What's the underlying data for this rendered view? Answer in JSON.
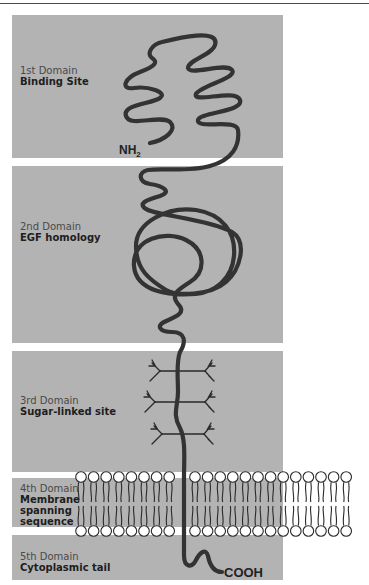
{
  "figure": {
    "type": "protein domain structure diagram",
    "colors": {
      "panel": "#b3b3b3",
      "chain": "#333333",
      "background": "#ffffff",
      "lipid_head": "#ffffff"
    },
    "domains": [
      {
        "number": "1st Domain",
        "name": "Binding Site"
      },
      {
        "number": "2nd Domain",
        "name": "EGF homology"
      },
      {
        "number": "3rd Domain",
        "name": "Sugar-linked site"
      },
      {
        "number": "4th Domain",
        "name": "Membrane spanning sequence",
        "name_lines": [
          "Membrane",
          "spanning",
          "sequence"
        ]
      },
      {
        "number": "5th Domain",
        "name": "Cytoplasmic tail"
      }
    ],
    "termini": {
      "n_terminus": "NH",
      "n_terminus_sub": "2",
      "c_terminus": "COOH"
    },
    "membrane": {
      "lipid_heads_per_row": 21,
      "rows": 2
    },
    "sugar_chains": 3
  }
}
